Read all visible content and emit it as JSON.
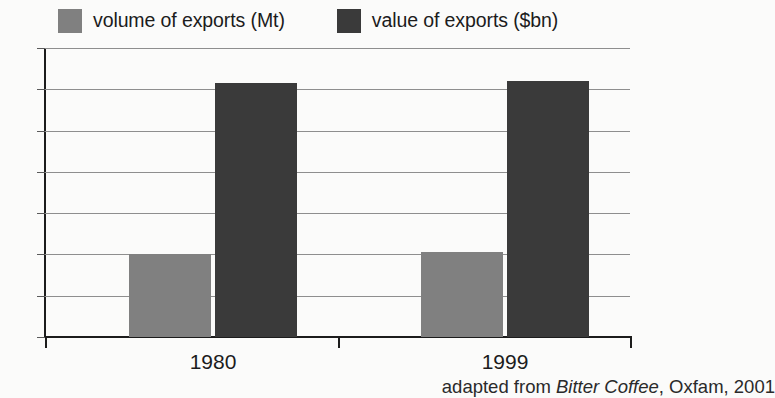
{
  "legend": {
    "items": [
      {
        "label": "volume of exports (Mt)",
        "color": "#808080",
        "swatch_name": "legend-swatch-volume"
      },
      {
        "label": "value of exports ($bn)",
        "color": "#3a3a3a",
        "swatch_name": "legend-swatch-value"
      }
    ]
  },
  "axis": {
    "y_ticks": [
      "14",
      "12",
      "10",
      "8",
      "6",
      "4",
      "2",
      "0"
    ],
    "x_categories": [
      "1980",
      "1999"
    ]
  },
  "caption": {
    "prefix": "adapted from ",
    "book": "Bitter Coffee",
    "suffix": ", Oxfam, 2001"
  },
  "chart_data": {
    "type": "bar",
    "title": "",
    "subtitle": "",
    "xlabel": "",
    "ylabel": "",
    "categories": [
      "1980",
      "1999"
    ],
    "series": [
      {
        "name": "volume of exports (Mt)",
        "values": [
          4.0,
          4.1
        ],
        "color": "#808080"
      },
      {
        "name": "value of exports ($bn)",
        "values": [
          12.3,
          12.4
        ],
        "color": "#3a3a3a"
      }
    ],
    "ylim": [
      0,
      14
    ],
    "ytick_step": 2,
    "grid": true,
    "grid_axis": "y",
    "legend_position": "top",
    "source_note": "adapted from Bitter Coffee, Oxfam, 2001"
  }
}
